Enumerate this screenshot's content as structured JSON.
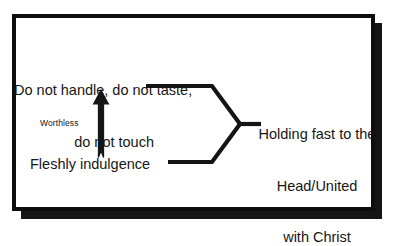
{
  "diagram": {
    "background_color": "#ffffff",
    "ink_color": "#161616",
    "frame": {
      "border_color": "#0d0d0d",
      "shadow_color": "#151515"
    },
    "nodes": {
      "prohibitions": {
        "line1": "Do not handle, do not taste,",
        "line2": "do not touch"
      },
      "fleshly": {
        "label": "Fleshly indulgence"
      },
      "arrow_label": {
        "label": "Worthless"
      },
      "outcome": {
        "line1": "Holding fast to the",
        "line2": "Head/United",
        "line3": "with Christ"
      }
    },
    "connectors": {
      "upper_branch": "horizontal line from prohibitions to brace apex",
      "lower_branch": "horizontal line from fleshly indulgence to brace apex",
      "brace_stub": "short line from brace vertex to outcome",
      "vertical_arrow": "upward arrow from fleshly indulgence to prohibitions labeled Worthless"
    }
  }
}
